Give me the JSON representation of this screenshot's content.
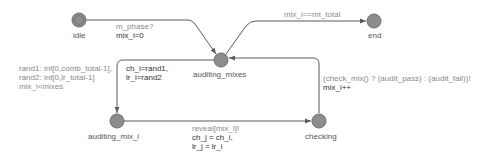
{
  "diagram": {
    "type": "timed-automaton",
    "colors": {
      "edge": "#5a5a5a",
      "node_fill": "#8c8c8c",
      "node_stroke": "#6e6e6e",
      "label_gray": "#8a8a8a",
      "label_dark": "#333333"
    },
    "locations": [
      {
        "id": "idle",
        "name": "idle",
        "initial": true
      },
      {
        "id": "auditing_mixes",
        "name": "auditing_mixes",
        "initial": false
      },
      {
        "id": "end",
        "name": "end",
        "initial": false
      },
      {
        "id": "auditing_mix_i",
        "name": "auditing_mix_i",
        "initial": false
      },
      {
        "id": "checking",
        "name": "checking",
        "initial": false
      }
    ],
    "edges": [
      {
        "from": "idle",
        "to": "auditing_mixes",
        "sync": "m_phase?",
        "update": "mix_i=0"
      },
      {
        "from": "auditing_mixes",
        "to": "end",
        "guard": "mix_i==mt_total"
      },
      {
        "from": "auditing_mixes",
        "to": "auditing_mix_i",
        "select": [
          "rand1: int[0,comb_total-1],",
          "rand2: int[0,lr_total-1]"
        ],
        "guard": "mix_i<mixes",
        "update": [
          "ch_i=rand1,",
          "lr_i=rand2"
        ]
      },
      {
        "from": "auditing_mix_i",
        "to": "checking",
        "sync": "reveal[mix_i]!",
        "update": [
          "ch_j = ch_i,",
          "lr_j = lr_i"
        ]
      },
      {
        "from": "checking",
        "to": "auditing_mixes",
        "sync": "(check_mix() ? (audit_pass) : (audit_fail))!",
        "update": "mix_i++"
      }
    ]
  }
}
